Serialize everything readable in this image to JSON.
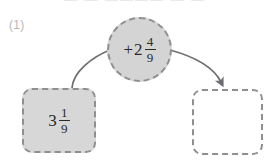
{
  "page": {
    "top_cut_text": "— — ———— —  —",
    "problem_number": "(1)"
  },
  "diagram": {
    "type": "function-machine",
    "input": {
      "label": "3 1/9",
      "whole": "3",
      "numerator": "1",
      "denominator": "9",
      "fill_color": "#d7d7d7",
      "border_style": "dashed"
    },
    "operator": {
      "label": "+2 4/9",
      "sign": "+",
      "whole": "2",
      "numerator": "4",
      "denominator": "9",
      "fill_color": "#d4d4d4",
      "border_style": "dashed"
    },
    "output": {
      "label": "",
      "placeholder": "",
      "fill_color": "#ffffff",
      "border_style": "dashed"
    },
    "connectors": [
      {
        "name": "input-to-operator",
        "from": "input-box",
        "to": "operator-circle",
        "arrowhead": false,
        "color": "#6d6d72"
      },
      {
        "name": "operator-to-output",
        "from": "operator-circle",
        "to": "output-box",
        "arrowhead": true,
        "color": "#6d6d72"
      }
    ]
  }
}
